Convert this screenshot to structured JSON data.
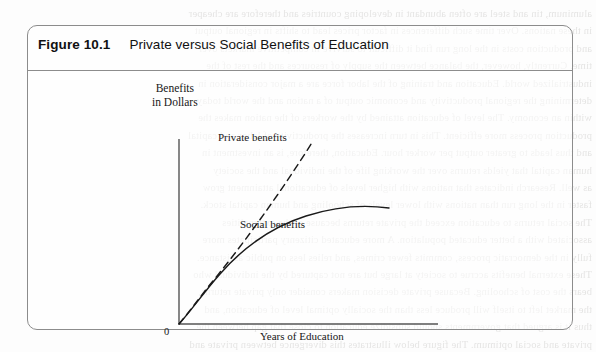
{
  "figure": {
    "number": "Figure 10.1",
    "caption": "Private versus Social Benefits of Education"
  },
  "chart_data": {
    "type": "line",
    "title": "Private versus Social Benefits of Education",
    "xlabel": "Years of Education",
    "ylabel": "Benefits in Dollars",
    "ylabel_line1": "Benefits",
    "ylabel_line2": "in Dollars",
    "origin_label": "0",
    "grid": false,
    "legend": "inline-annotations",
    "axis_ranges": {
      "x": [
        0,
        10
      ],
      "y": [
        0,
        10
      ]
    },
    "series": [
      {
        "name": "Private benefits",
        "style": "dashed",
        "color": "#1a1a1a",
        "annotation": "Private benefits",
        "x": [
          0,
          0.5,
          1,
          1.5,
          2,
          3,
          4,
          5,
          6,
          7,
          8
        ],
        "y": [
          0,
          1.0,
          1.9,
          2.6,
          3.2,
          4.4,
          5.5,
          6.5,
          7.4,
          8.2,
          9.0
        ]
      },
      {
        "name": "Social benefits",
        "style": "solid",
        "color": "#1a1a1a",
        "annotation": "Social benefits",
        "x": [
          0,
          0.5,
          1,
          1.5,
          2,
          3,
          4,
          5,
          6,
          7,
          8,
          9,
          10
        ],
        "y": [
          0,
          1.0,
          1.9,
          2.6,
          3.2,
          4.2,
          4.9,
          5.4,
          5.8,
          6.0,
          6.15,
          6.25,
          6.3
        ]
      }
    ],
    "annotations": [
      {
        "text": "Private benefits",
        "near": "dashed-curve-end"
      },
      {
        "text": "Social benefits",
        "near": "solid-curve-plateau"
      },
      {
        "text": "Years of Education",
        "near": "x-axis"
      },
      {
        "text": "0",
        "near": "origin"
      }
    ]
  },
  "colors": {
    "box_border": "#8c8c8c",
    "axis": "#555555",
    "curve": "#1a1a1a",
    "page_background": "#fdfdfd",
    "title_text": "#111111"
  },
  "background_bleed": {
    "description": "faint mirrored show-through text from the reverse page",
    "lines": [
      "aluminum, tin and steel are often abundant in developing countries and therefore are cheaper",
      "in these nations. Over time such differences in factor prices lead to shifts in regional output",
      "and production costs in the long run find it difficult to survive in competitive markets over",
      "time. Currently, however, the balance between the supply of resources and the rest of the",
      "industrialized world. Education and training of the labor force are a major consideration in",
      "determining the regional productivity and economic output of a nation and the world today",
      "within an economy. The level of education attained by the workers of the nation makes the",
      "production process more efficient. This in turn increases the productivity of labor and capital",
      "and thus leads to greater output per worker hour. Education, therefore, is an investment in",
      "human capital that yields returns over the working life of the individual and the society",
      "as well. Research indicates that nations with higher levels of educational attainment grow",
      "faster in the long run than nations with lower levels of schooling and human capital stock.",
      "The social returns to education exceed the private returns because of the externalities",
      "associated with a better educated population. A more educated citizenry participates more",
      "fully in the democratic process, commits fewer crimes, and relies less on public assistance.",
      "These external benefits accrue to society at large but are not captured by the individual who",
      "bears the cost of schooling. Because private decision makers consider only private returns,",
      "the market left to itself will produce less than the socially optimal level of education, and",
      "thus it is argued that governments should subsidize education to close that gap between the",
      "private and social optimum. The figure below illustrates this divergence between private and",
      "social benefits as the years of schooling increase beyond the elementary and basic levels."
    ]
  }
}
